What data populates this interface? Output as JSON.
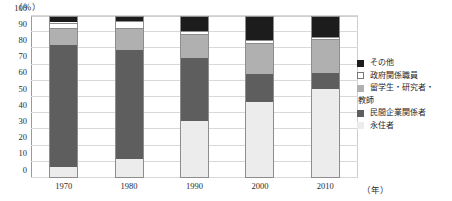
{
  "chart_data": {
    "type": "bar",
    "subtype": "stacked-100-percent",
    "title": "",
    "xlabel": "年",
    "ylabel": "(％)",
    "ylim": [
      0,
      100
    ],
    "yticks": [
      0,
      10,
      20,
      30,
      40,
      50,
      60,
      70,
      80,
      90,
      100
    ],
    "grid": true,
    "legend_position": "right",
    "categories": [
      "1970",
      "1980",
      "1990",
      "2000",
      "2010"
    ],
    "series": [
      {
        "name": "その他",
        "key": "other",
        "color": "#1c1c1c",
        "values": [
          4,
          3,
          9,
          15,
          13
        ]
      },
      {
        "name": "政府関係職員",
        "key": "gov",
        "color": "#ffffff",
        "values": [
          4,
          5,
          3,
          2,
          2
        ]
      },
      {
        "name": "留学生・研究者・教師",
        "key": "student",
        "color": "#b0b0b0",
        "values": [
          10,
          13,
          14,
          19,
          20
        ]
      },
      {
        "name": "民間企業関係者",
        "key": "private",
        "color": "#5e5e5e",
        "values": [
          75,
          67,
          38.5,
          17,
          10
        ]
      },
      {
        "name": "永住者",
        "key": "permanent",
        "color": "#ececec",
        "values": [
          7,
          12,
          35.5,
          47,
          55
        ]
      }
    ]
  },
  "axes": {
    "y_unit_label": "（％）",
    "y_tick_labels": [
      "0",
      "10",
      "20",
      "30",
      "40",
      "50",
      "60",
      "70",
      "80",
      "90",
      "100"
    ],
    "x_tick_labels": [
      "1970",
      "1980",
      "1990",
      "2000",
      "2010"
    ],
    "x_unit_label": "（年）"
  },
  "legend": {
    "items": [
      {
        "label": "その他",
        "swatch": "sw-other",
        "continuation": ""
      },
      {
        "label": "政府関係職員",
        "swatch": "sw-gov",
        "continuation": ""
      },
      {
        "label": "留学生・研究者・",
        "swatch": "sw-student",
        "continuation": "教師"
      },
      {
        "label": "民間企業関係者",
        "swatch": "sw-private",
        "continuation": ""
      },
      {
        "label": "永住者",
        "swatch": "sw-permanent",
        "continuation": ""
      }
    ]
  }
}
